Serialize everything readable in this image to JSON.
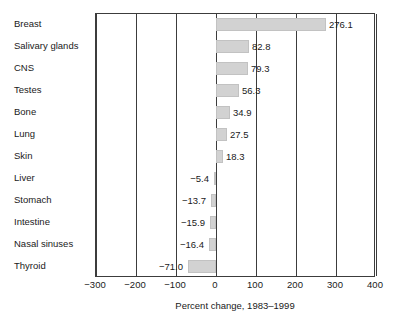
{
  "chart_data": {
    "type": "bar",
    "orientation": "horizontal",
    "title": "",
    "xlabel": "Percent change, 1983–1999",
    "ylabel": "",
    "xlim": [
      -300,
      400
    ],
    "xticks": [
      -300,
      -200,
      -100,
      0,
      100,
      200,
      300,
      400
    ],
    "xticklabels": [
      "−300",
      "−200",
      "−100",
      "0",
      "100",
      "200",
      "300",
      "400"
    ],
    "grid": true,
    "grid_axis": "x",
    "legend": false,
    "bar_color": "#d2d2d2",
    "categories": [
      "Breast",
      "Salivary glands",
      "CNS",
      "Testes",
      "Bone",
      "Lung",
      "Skin",
      "Liver",
      "Stomach",
      "Intestine",
      "Nasal sinuses",
      "Thyroid"
    ],
    "values": [
      276.1,
      82.8,
      79.3,
      56.3,
      34.9,
      27.5,
      18.3,
      -5.4,
      -13.7,
      -15.9,
      -16.4,
      -71.0
    ],
    "value_labels": [
      "276.1",
      "82.8",
      "79.3",
      "56.3",
      "34.9",
      "27.5",
      "18.3",
      "−5.4",
      "−13.7",
      "−15.9",
      "−16.4",
      "−71.0"
    ]
  }
}
